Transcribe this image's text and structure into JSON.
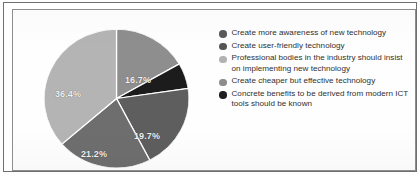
{
  "figure": {
    "background_color": "#ffffff",
    "frame_color": "#6f6f6f"
  },
  "chart_data": {
    "type": "pie",
    "title": "",
    "xlabel": "",
    "ylabel": "",
    "legend_position": "right",
    "grid": false,
    "label_format": "percent",
    "categories": [
      "Create more awareness of new technology",
      "Create user-friendly technology",
      "Professional bodies in the industry should insist on implementing new technology",
      "Create cheaper but effective technology",
      "Concrete benefits to be derived from modern ICT tools should be known"
    ],
    "values": [
      16.7,
      19.7,
      36.4,
      21.2,
      6.0
    ],
    "slice_colors": [
      "#8e8e8e",
      "#5e5e5e",
      "#b4b4b4",
      "#6e6e6e",
      "#1c1c1c"
    ],
    "slices": [
      {
        "label": "16.7%",
        "value": 16.7,
        "color": "#8e8e8e",
        "legend_index": 0
      },
      {
        "label": "",
        "value": 6.0,
        "color": "#1c1c1c",
        "legend_index": 4
      },
      {
        "label": "19.7%",
        "value": 19.7,
        "color": "#5e5e5e",
        "legend_index": 1
      },
      {
        "label": "21.2%",
        "value": 21.2,
        "color": "#6e6e6e",
        "legend_index": 3
      },
      {
        "label": "36.4%",
        "value": 36.4,
        "color": "#b4b4b4",
        "legend_index": 2
      }
    ],
    "slice_label_color": "#f2f2f2",
    "slice_border_color": "#ffffff"
  },
  "labels": {
    "slice_0": "16.7%",
    "slice_2": "19.7%",
    "slice_3": "21.2%",
    "slice_4": "36.4%"
  },
  "legend": {
    "items": [
      {
        "label": "Create more awareness of new technology",
        "color": "#5a5a5a"
      },
      {
        "label": "Create user-friendly technology",
        "color": "#555555"
      },
      {
        "label": "Professional bodies in the industry should insist on implementing new technology",
        "color": "#b2b2b2"
      },
      {
        "label": "Create cheaper but effective technology",
        "color": "#8c8c8c"
      },
      {
        "label": "Concrete benefits to be derived from modern ICT tools should be known",
        "color": "#1e1e1e"
      }
    ]
  }
}
